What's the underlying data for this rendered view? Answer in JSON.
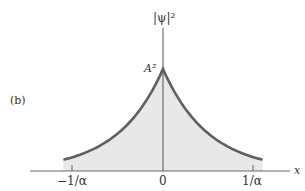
{
  "panel_label": "(b)",
  "chart_data": {
    "type": "area",
    "title": "",
    "function": "|psi|^2 = A^2 exp(-2 alpha |x|)",
    "xlabel": "x",
    "ylabel": "|ψ|²",
    "peak_label": "A²",
    "x_ticks": [
      {
        "value": -1,
        "label": "−1/α"
      },
      {
        "value": 0,
        "label": "0"
      },
      {
        "value": 1,
        "label": "1/α"
      }
    ],
    "x_units": "1/α",
    "xlim": [
      -1.1,
      1.1
    ],
    "ylim": [
      0,
      1
    ],
    "x": [
      -1.1,
      -1.0,
      -0.8,
      -0.6,
      -0.4,
      -0.2,
      0,
      0.2,
      0.4,
      0.6,
      0.8,
      1.0,
      1.1
    ],
    "values": [
      0.111,
      0.135,
      0.202,
      0.301,
      0.449,
      0.67,
      1.0,
      0.67,
      0.449,
      0.301,
      0.202,
      0.135,
      0.111
    ],
    "grid": false,
    "legend": null,
    "colors": {
      "curve": "#5f5f5f",
      "fill": "#e6e6e6",
      "axis": "#555555"
    }
  }
}
